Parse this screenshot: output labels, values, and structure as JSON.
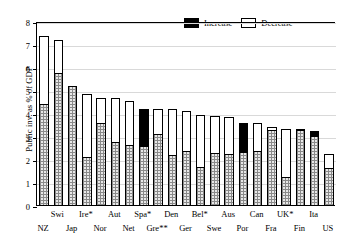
{
  "chart_data": {
    "type": "bar",
    "title": "",
    "subtitle": "",
    "xlabel": "",
    "ylabel": "Public inv. as % of GDP",
    "ylim": [
      0,
      8
    ],
    "yticks": [
      0,
      1,
      2,
      3,
      4,
      5,
      6,
      7,
      8
    ],
    "ytick_labels": [
      "0",
      "1",
      "2",
      "3",
      "4",
      "5",
      "6",
      "7",
      "8"
    ],
    "grid": true,
    "stacked": true,
    "legend_position": "top-right",
    "legend": [
      {
        "name": "Increase",
        "color": "#000000"
      },
      {
        "name": "Decrease",
        "color": "#ffffff"
      }
    ],
    "categories": [
      "NZ",
      "Swi",
      "Jap",
      "Ire*",
      "Nor",
      "Aut",
      "Net",
      "Spa*",
      "Gre**",
      "Den",
      "Ger",
      "Bel*",
      "Swe",
      "Aus",
      "Por",
      "Can",
      "Fra",
      "UK*",
      "Fin",
      "Ita",
      "US"
    ],
    "series": [
      {
        "name": "Base",
        "values": [
          4.45,
          5.8,
          5.2,
          2.15,
          3.6,
          2.8,
          2.65,
          2.6,
          3.15,
          2.2,
          2.4,
          1.7,
          2.3,
          2.25,
          2.35,
          2.4,
          3.3,
          1.25,
          3.3,
          3.05,
          1.65
        ]
      },
      {
        "name": "Change",
        "values": [
          2.95,
          1.4,
          0.0,
          2.7,
          1.1,
          1.9,
          1.9,
          1.6,
          1.05,
          2.0,
          1.75,
          2.25,
          1.6,
          1.6,
          1.25,
          1.2,
          0.15,
          2.1,
          0.05,
          0.2,
          0.6
        ]
      }
    ],
    "totals": [
      7.4,
      7.2,
      5.2,
      4.85,
      4.7,
      4.7,
      4.55,
      4.2,
      4.2,
      4.2,
      4.15,
      3.95,
      3.9,
      3.85,
      3.6,
      3.6,
      3.45,
      3.35,
      3.35,
      3.25,
      2.25
    ],
    "change_kind": [
      "decrease",
      "decrease",
      "none",
      "decrease",
      "decrease",
      "decrease",
      "decrease",
      "increase",
      "decrease",
      "decrease",
      "decrease",
      "decrease",
      "decrease",
      "decrease",
      "increase",
      "decrease",
      "decrease",
      "decrease",
      "decrease",
      "increase",
      "decrease"
    ],
    "label_row": [
      "bot",
      "top",
      "bot",
      "top",
      "bot",
      "top",
      "bot",
      "top",
      "bot",
      "top",
      "bot",
      "top",
      "bot",
      "top",
      "bot",
      "top",
      "bot",
      "top",
      "bot",
      "top",
      "bot"
    ]
  }
}
